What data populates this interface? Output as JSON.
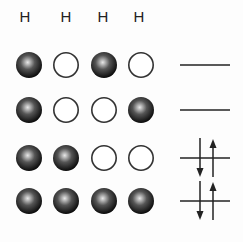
{
  "header": {
    "labels": [
      "H",
      "H",
      "H",
      "H"
    ]
  },
  "rows": [
    {
      "spheres": [
        "filled",
        "empty",
        "filled",
        "empty"
      ],
      "symbol": "line"
    },
    {
      "spheres": [
        "filled",
        "empty",
        "empty",
        "filled"
      ],
      "symbol": "line"
    },
    {
      "spheres": [
        "filled",
        "filled",
        "empty",
        "empty"
      ],
      "symbol": "spin-pair-arrows"
    },
    {
      "spheres": [
        "filled",
        "filled",
        "filled",
        "filled"
      ],
      "symbol": "spin-pair-arrows"
    }
  ],
  "colors": {
    "filled_sphere": "#1a1a1a",
    "empty_sphere_stroke": "#333333",
    "line": "#222222"
  }
}
